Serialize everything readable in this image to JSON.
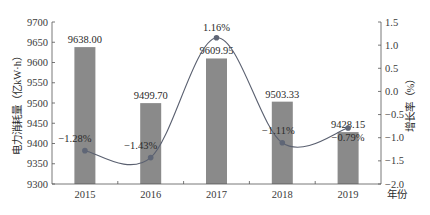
{
  "chart_data": {
    "type": "bar+line",
    "title": "",
    "categories": [
      "2015",
      "2016",
      "2017",
      "2018",
      "2019"
    ],
    "xlabel": "年份",
    "series": [
      {
        "name": "电力消耗量",
        "type": "bar",
        "axis": "left",
        "values": [
          9638.0,
          9499.7,
          9609.95,
          9503.33,
          9428.15
        ],
        "labels": [
          "9638.00",
          "9499.70",
          "9609.95",
          "9503.33",
          "9428.15"
        ],
        "color": "#8a8a8a"
      },
      {
        "name": "增长率",
        "type": "line",
        "axis": "right",
        "smooth": true,
        "values": [
          -1.28,
          -1.43,
          1.16,
          -1.11,
          -0.79
        ],
        "labels": [
          "-1.28%",
          "-1.43%",
          "1.16%",
          "-1.11%",
          "-0.79%"
        ],
        "color": "#5a6070"
      }
    ],
    "y_left": {
      "label": "电力消耗量（亿kW·h）",
      "ylim": [
        9300,
        9700
      ],
      "ticks": [
        "9300",
        "9350",
        "9400",
        "9450",
        "9500",
        "9550",
        "9600",
        "9650",
        "9700"
      ]
    },
    "y_right": {
      "label": "增长率（%）",
      "ylim": [
        -2.0,
        1.5
      ],
      "ticks": [
        "-2.0",
        "-1.5",
        "-1.0",
        "-0.5",
        "0.0",
        "0.5",
        "1.0",
        "1.5"
      ]
    },
    "grid": false,
    "legend": null
  }
}
